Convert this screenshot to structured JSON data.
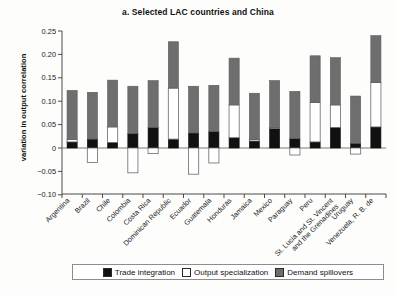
{
  "chart_data": {
    "type": "bar",
    "subtype": "stacked-bar-with-negatives",
    "title": "a. Selected LAC countries and China",
    "xlabel": "",
    "ylabel": "variation in output correlation",
    "ylim": [
      -0.1,
      0.25
    ],
    "yticks": [
      -0.1,
      -0.05,
      0,
      0.05,
      0.1,
      0.15,
      0.2,
      0.25
    ],
    "ytick_labels": [
      "−0.10",
      "−0.05",
      "0",
      "0.05",
      "0.10",
      "0.15",
      "0.20",
      "0.25"
    ],
    "grid": false,
    "legend_position": "bottom",
    "categories": [
      "Argentina",
      "Brazil",
      "Chile",
      "Colombia",
      "Costa Rica",
      "Dominican Republic",
      "Ecuador",
      "Guatemala",
      "Honduras",
      "Jamaica",
      "Mexico",
      "Paraguay",
      "Peru",
      "St. Lucia and St. Vincent and the Grenadines",
      "Uruguay",
      "Venezuela, R. B. de"
    ],
    "category_labels_multiline": [
      [
        "Argentina"
      ],
      [
        "Brazil"
      ],
      [
        "Chile"
      ],
      [
        "Colombia"
      ],
      [
        "Costa Rica"
      ],
      [
        "Dominican Republic"
      ],
      [
        "Ecuador"
      ],
      [
        "Guatemala"
      ],
      [
        "Honduras"
      ],
      [
        "Jamaica"
      ],
      [
        "Mexico"
      ],
      [
        "Paraguay"
      ],
      [
        "Peru"
      ],
      [
        "St. Lucia and St. Vincent",
        "and the Grenadines"
      ],
      [
        "Uruguay"
      ],
      [
        "Venezuela, R. B. de"
      ]
    ],
    "series": [
      {
        "name": "Trade integration",
        "color": "#111111",
        "values": [
          0.013,
          0.019,
          0.012,
          0.031,
          0.044,
          0.019,
          0.032,
          0.035,
          0.022,
          0.015,
          0.042,
          0.02,
          0.013,
          0.044,
          0.01,
          0.045
        ]
      },
      {
        "name": "Output specialization",
        "color": "#ffffff",
        "values": [
          0.005,
          -0.031,
          0.033,
          -0.053,
          -0.012,
          0.109,
          -0.056,
          -0.032,
          0.07,
          0.003,
          0.002,
          -0.015,
          0.084,
          0.048,
          -0.013,
          0.095
        ]
      },
      {
        "name": "Demand spillovers",
        "color": "#6e6e6e",
        "values": [
          0.105,
          0.1,
          0.1,
          0.101,
          0.1,
          0.099,
          0.1,
          0.099,
          0.1,
          0.099,
          0.1,
          0.101,
          0.1,
          0.101,
          0.101,
          0.1
        ]
      }
    ],
    "totals_positive": [
      0.123,
      0.119,
      0.145,
      0.132,
      0.144,
      0.227,
      0.132,
      0.134,
      0.192,
      0.117,
      0.144,
      0.121,
      0.197,
      0.193,
      0.111,
      0.24
    ],
    "negatives": [
      0.0,
      -0.031,
      0.0,
      -0.053,
      -0.012,
      0.0,
      -0.056,
      -0.032,
      0.0,
      0.0,
      0.0,
      -0.015,
      0.0,
      0.0,
      -0.013,
      0.0
    ]
  },
  "legend": {
    "items": [
      {
        "label": "Trade integration",
        "color": "#111111"
      },
      {
        "label": "Output specialization",
        "color": "#ffffff"
      },
      {
        "label": "Demand spillovers",
        "color": "#6e6e6e"
      }
    ]
  }
}
